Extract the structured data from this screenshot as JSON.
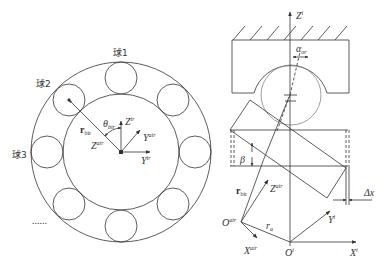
{
  "left_figure": {
    "ball_labels": [
      "球1",
      "球2",
      "球3"
    ],
    "ellipsis": "......",
    "labels": {
      "theta": "θ",
      "theta_sub": "bir",
      "r_bir": "r",
      "r_bir_sub": "bir",
      "z_ir": "Z",
      "z_ir_sup": "ir",
      "y_air": "Y",
      "y_air_sup": "air",
      "z_air": "Z",
      "z_air_sup": "air",
      "y_ir": "Y",
      "y_ir_sup": "ir"
    }
  },
  "right_figure": {
    "labels": {
      "z_i": "Z",
      "z_i_sup": "i",
      "alpha": "α",
      "alpha_sub": "or",
      "beta": "β",
      "r_bir": "r",
      "r_bir_sub": "bir",
      "z_air": "Z",
      "z_air_sup": "air",
      "delta_x": "Δx",
      "o_air": "O",
      "o_air_sup": "air",
      "r_a": "r",
      "r_a_sub": "a",
      "y_i": "Y",
      "y_i_sup": "i",
      "x_air": "X",
      "x_air_sup": "air",
      "o_i": "O",
      "o_i_sup": "i",
      "x_i": "X",
      "x_i_sup": "i"
    }
  },
  "colors": {
    "line": "#333333",
    "ball_gray": "#888888"
  }
}
